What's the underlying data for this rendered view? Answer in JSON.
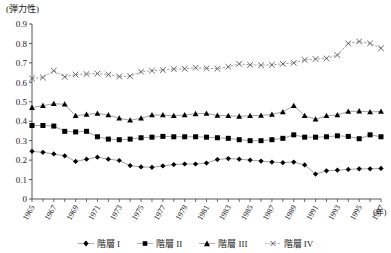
{
  "chart_data": {
    "type": "line",
    "title": "",
    "ylabel": "(弾力性)",
    "xlabel": "(年)",
    "ylim": [
      0,
      0.9
    ],
    "ytick_labels": [
      "0",
      "0.1",
      "0.2",
      "0.3",
      "0.4",
      "0.5",
      "0.6",
      "0.7",
      "0.8",
      "0.9"
    ],
    "ytick_values": [
      0,
      0.1,
      0.2,
      0.3,
      0.4,
      0.5,
      0.6,
      0.7,
      0.8,
      0.9
    ],
    "grid": false,
    "legend_position": "bottom",
    "x": [
      1965,
      1966,
      1967,
      1968,
      1969,
      1970,
      1971,
      1972,
      1973,
      1974,
      1975,
      1976,
      1977,
      1978,
      1979,
      1980,
      1981,
      1982,
      1983,
      1984,
      1985,
      1986,
      1987,
      1988,
      1989,
      1990,
      1991,
      1992,
      1993,
      1994,
      1995,
      1996,
      1997
    ],
    "xtick_labels": [
      "1965",
      "1967",
      "1969",
      "1971",
      "1973",
      "1975",
      "1977",
      "1979",
      "1981",
      "1983",
      "1985",
      "1987",
      "1989",
      "1991",
      "1993",
      "1995",
      "1997"
    ],
    "xtick_values": [
      1965,
      1967,
      1969,
      1971,
      1973,
      1975,
      1977,
      1979,
      1981,
      1983,
      1985,
      1987,
      1989,
      1991,
      1993,
      1995,
      1997
    ],
    "series": [
      {
        "name": "階層 I",
        "marker": "diamond",
        "values": [
          0.245,
          0.24,
          0.232,
          0.222,
          0.193,
          0.205,
          0.215,
          0.205,
          0.198,
          0.172,
          0.165,
          0.163,
          0.17,
          0.177,
          0.18,
          0.18,
          0.185,
          0.203,
          0.208,
          0.205,
          0.2,
          0.195,
          0.19,
          0.187,
          0.19,
          0.175,
          0.128,
          0.145,
          0.148,
          0.152,
          0.155,
          0.155,
          0.157
        ]
      },
      {
        "name": "階層 II",
        "marker": "square",
        "values": [
          0.378,
          0.378,
          0.375,
          0.348,
          0.345,
          0.348,
          0.32,
          0.308,
          0.305,
          0.308,
          0.315,
          0.318,
          0.322,
          0.32,
          0.32,
          0.32,
          0.318,
          0.315,
          0.312,
          0.305,
          0.3,
          0.3,
          0.305,
          0.312,
          0.33,
          0.318,
          0.318,
          0.32,
          0.325,
          0.322,
          0.31,
          0.33,
          0.32
        ]
      },
      {
        "name": "階層 III",
        "marker": "triangle",
        "values": [
          0.47,
          0.48,
          0.49,
          0.487,
          0.428,
          0.435,
          0.44,
          0.432,
          0.415,
          0.405,
          0.415,
          0.432,
          0.432,
          0.428,
          0.432,
          0.438,
          0.44,
          0.43,
          0.428,
          0.425,
          0.428,
          0.43,
          0.435,
          0.448,
          0.48,
          0.428,
          0.41,
          0.428,
          0.432,
          0.45,
          0.452,
          0.448,
          0.45
        ]
      },
      {
        "name": "階層 IV",
        "marker": "cross",
        "values": [
          0.62,
          0.625,
          0.66,
          0.628,
          0.64,
          0.643,
          0.645,
          0.64,
          0.63,
          0.632,
          0.655,
          0.66,
          0.663,
          0.668,
          0.67,
          0.675,
          0.672,
          0.67,
          0.68,
          0.695,
          0.69,
          0.688,
          0.69,
          0.695,
          0.7,
          0.715,
          0.72,
          0.723,
          0.74,
          0.8,
          0.81,
          0.8,
          0.775
        ]
      }
    ]
  },
  "colors": {
    "axis": "#444444",
    "series1": "#000000",
    "series2": "#000000",
    "series3": "#000000",
    "series4": "#777777",
    "line": "#999999"
  }
}
